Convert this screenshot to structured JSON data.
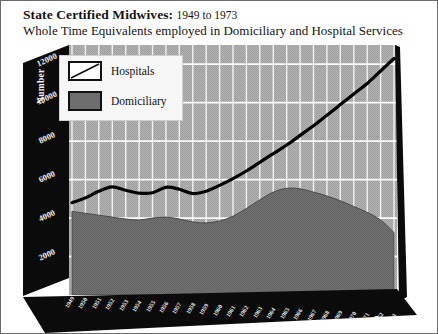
{
  "title": {
    "main": "State Certified Midwives:",
    "range": "1949 to 1973",
    "subtitle": "Whole Time Equivalents employed in Domiciliary and Hospital Services"
  },
  "axes": {
    "y_title": "Number",
    "x_title": "Year"
  },
  "legend": {
    "items": [
      {
        "label": "Hospitals",
        "swatch": "white-box-with-diagonal"
      },
      {
        "label": "Domiciliary",
        "swatch": "dark-grey-filled-box"
      }
    ]
  },
  "chart_data": {
    "type": "area",
    "xlabel": "Year",
    "ylabel": "Number",
    "xlim": [
      1949,
      1973
    ],
    "ylim": [
      0,
      13000
    ],
    "yticks": [
      2000,
      4000,
      6000,
      8000,
      10000,
      12000
    ],
    "ytick_labels": [
      "2000",
      "4000",
      "6000",
      "8000",
      "10000",
      "12000"
    ],
    "grid": true,
    "legend_position": "top-left",
    "categories": [
      1949,
      1950,
      1951,
      1952,
      1953,
      1954,
      1955,
      1956,
      1957,
      1958,
      1959,
      1960,
      1961,
      1962,
      1963,
      1964,
      1965,
      1966,
      1967,
      1968,
      1969,
      1970,
      1971,
      1972,
      1973
    ],
    "xtick_labels": [
      "1949",
      "1950",
      "1951",
      "1952",
      "1953",
      "1954",
      "1955",
      "1956",
      "1957",
      "1958",
      "1959",
      "1960",
      "1961",
      "1962",
      "1963",
      "1964",
      "1965",
      "1966",
      "1967",
      "1968",
      "1969",
      "1970",
      "1971",
      "1972",
      "1973"
    ],
    "series": [
      {
        "name": "Hospitals",
        "style": "thick black line",
        "values": [
          4800,
          5050,
          5400,
          5620,
          5450,
          5300,
          5320,
          5600,
          5500,
          5280,
          5400,
          5700,
          6050,
          6450,
          6900,
          7350,
          7800,
          8300,
          8800,
          9350,
          9900,
          10450,
          11000,
          11650,
          12300
        ]
      },
      {
        "name": "Domiciliary",
        "style": "dark grey filled area",
        "values": [
          4350,
          4250,
          4150,
          4050,
          3950,
          3900,
          4000,
          4050,
          3950,
          3800,
          3750,
          3850,
          4100,
          4500,
          4950,
          5350,
          5550,
          5520,
          5350,
          5150,
          4900,
          4600,
          4300,
          3900,
          3250
        ]
      }
    ]
  }
}
